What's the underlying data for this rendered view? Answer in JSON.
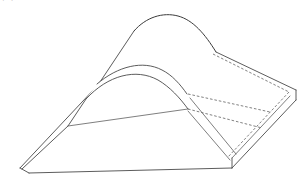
{
  "page": {
    "width": 307,
    "height": 184,
    "background_color": "#ffffff"
  },
  "caption": {
    "text": "图3-17　连续曲面件在凸模的设计和凹模上的夹紧设计",
    "note": "line of text cropped at top edge, only the lower fragments of the glyphs are visible",
    "color": "#3a3a3a"
  },
  "figure": {
    "name": "curved-bent-plate-perspective-drawing",
    "type": "engineering-line-drawing",
    "line_color": "#4a4a4a",
    "hidden_line_color": "#6a6a6a",
    "fill_color": "#ffffff",
    "line_width": 0.9,
    "hidden_line_dash": "2.6 1.9",
    "geometry": {
      "arch_apex": [
        168,
        6
      ],
      "wedge_tip": [
        20,
        160
      ],
      "slab_right_corner": [
        296,
        82
      ],
      "slab_bottom_corner": [
        232,
        160
      ],
      "inner_curve_left_start": [
        97,
        76
      ],
      "inner_curve_right_end": [
        160,
        84
      ]
    },
    "elements": [
      {
        "name": "outer-arch-crest-curve",
        "kind": "solid",
        "path": "M 134 23 C 146 9 163 4 178 8 C 193 12 205 26 216 44"
      },
      {
        "name": "top-face-left-ruling",
        "kind": "solid",
        "path": "M 134 23 L 98 77"
      },
      {
        "name": "top-face-left-long-edge",
        "kind": "solid",
        "path": "M 98 77 L 20 160"
      },
      {
        "name": "inner-arch-upper-curve",
        "kind": "solid",
        "path": "M 97 76 C 118 58 143 52 162 62 C 172 67 180 76 187 86"
      },
      {
        "name": "inner-arch-lower-curve",
        "kind": "solid",
        "path": "M 86 91 C 108 67 136 60 158 72 C 170 79 180 90 188 101"
      },
      {
        "name": "inner-underside-ruling",
        "kind": "solid",
        "path": "M 86 91 L 68 118"
      },
      {
        "name": "underside-valley-edge",
        "kind": "solid",
        "path": "M 68 118 L 22 161"
      },
      {
        "name": "wedge-tip-short-edge",
        "kind": "solid",
        "path": "M 20 160 L 29 165"
      },
      {
        "name": "wedge-bottom-edge",
        "kind": "solid",
        "path": "M 29 165 L 232 160"
      },
      {
        "name": "slab-right-top-edge",
        "kind": "solid",
        "path": "M 216 44 L 296 82"
      },
      {
        "name": "slab-right-side-edge",
        "kind": "solid",
        "path": "M 296 82 L 296 92"
      },
      {
        "name": "slab-right-lower-edge",
        "kind": "solid",
        "path": "M 296 92 L 232 160"
      },
      {
        "name": "slab-bottom-corner-edge",
        "kind": "solid",
        "path": "M 232 160 L 232 150"
      },
      {
        "name": "slab-thickness-front-edge",
        "kind": "solid",
        "path": "M 232 150 L 290 88"
      },
      {
        "name": "slab-inner-hidden-diagonal",
        "kind": "hidden",
        "path": "M 213 46 L 289 84"
      },
      {
        "name": "slab-inner-hidden-return",
        "kind": "hidden",
        "path": "M 289 84 L 228 149"
      },
      {
        "name": "inner-pocket-hidden-edge-upper",
        "kind": "hidden",
        "path": "M 188 86 L 270 104"
      },
      {
        "name": "inner-pocket-hidden-edge-lower",
        "kind": "hidden",
        "path": "M 188 101 L 262 120"
      },
      {
        "name": "inner-pocket-ramp-line",
        "kind": "solid",
        "path": "M 190 90 L 236 146"
      },
      {
        "name": "inner-pocket-bottom-line",
        "kind": "solid",
        "path": "M 188 103 L 230 152"
      },
      {
        "name": "valley-fold-line",
        "kind": "solid",
        "path": "M 68 118 L 188 101"
      }
    ]
  }
}
